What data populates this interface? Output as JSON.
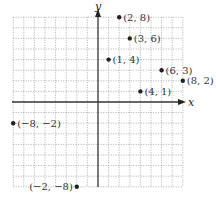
{
  "chart_data": {
    "type": "scatter",
    "title": "",
    "xlabel": "x",
    "ylabel": "y",
    "xlim": [
      -8,
      8
    ],
    "ylim": [
      -8,
      8
    ],
    "grid": true,
    "grid_style": "dotted",
    "points": [
      {
        "x": 2,
        "y": 8,
        "label": "(2, 8)"
      },
      {
        "x": 3,
        "y": 6,
        "label": "(3, 6)"
      },
      {
        "x": 1,
        "y": 4,
        "label": "(1, 4)"
      },
      {
        "x": 6,
        "y": 3,
        "label": "(6, 3)"
      },
      {
        "x": 8,
        "y": 2,
        "label": "(8, 2)"
      },
      {
        "x": 4,
        "y": 1,
        "label": "(4, 1)"
      },
      {
        "x": -8,
        "y": -2,
        "label": "(−8, −2)"
      },
      {
        "x": -2,
        "y": -8,
        "label": "(−2, −8)"
      }
    ]
  },
  "axes": {
    "x_label": "x",
    "y_label": "y"
  },
  "colors": {
    "grid": "#9a9a9a",
    "axis": "#333333",
    "point": "#222222"
  }
}
